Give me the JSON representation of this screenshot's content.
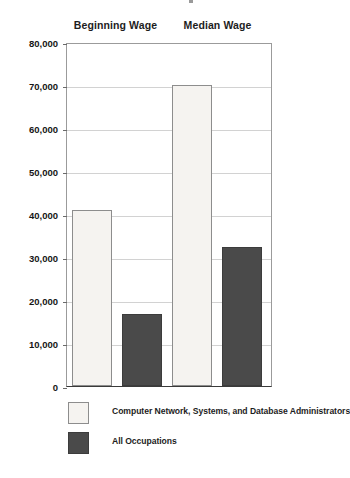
{
  "chart_data": {
    "type": "bar",
    "title": "",
    "subtitle": "",
    "xlabel": "",
    "ylabel": "",
    "grid": true,
    "legend_position": "bottom-left",
    "ylim": [
      0,
      80000
    ],
    "ytick_labels": [
      "80,000",
      "70,000",
      "60,000",
      "50,000",
      "40,000",
      "30,000",
      "20,000",
      "10,000",
      "0"
    ],
    "ytick_values": [
      80000,
      70000,
      60000,
      50000,
      40000,
      30000,
      20000,
      10000,
      0
    ],
    "categories": [
      "Beginning Wage",
      "Median Wage"
    ],
    "series": [
      {
        "name": "Computer Network, Systems, and Database Administrators",
        "color": "#f5f3f0",
        "values": [
          41000,
          70000
        ]
      },
      {
        "name": "All Occupations",
        "color": "#4a4a4a",
        "values": [
          16700,
          32400
        ]
      }
    ]
  },
  "headers": [
    {
      "label": "Beginning Wage"
    },
    {
      "label": "Median Wage"
    }
  ],
  "axis": {
    "ticks": [
      {
        "label": "80,000",
        "value": 80000
      },
      {
        "label": "70,000",
        "value": 70000
      },
      {
        "label": "60,000",
        "value": 60000
      },
      {
        "label": "50,000",
        "value": 50000
      },
      {
        "label": "40,000",
        "value": 40000
      },
      {
        "label": "30,000",
        "value": 30000
      },
      {
        "label": "20,000",
        "value": 20000
      },
      {
        "label": "10,000",
        "value": 10000
      },
      {
        "label": "0",
        "value": 0
      }
    ]
  },
  "bars": [
    {
      "label": "Beginning Wage - Computer Network, Systems, and Database Administrators",
      "value": 41000,
      "style": "light"
    },
    {
      "label": "Beginning Wage - All Occupations",
      "value": 16700,
      "style": "dark"
    },
    {
      "label": "Median Wage - Computer Network, Systems, and Database Administrators",
      "value": 70000,
      "style": "light"
    },
    {
      "label": "Median Wage - All Occupations",
      "value": 32400,
      "style": "dark"
    }
  ],
  "legend": {
    "items": [
      {
        "label": "Computer Network, Systems, and Database Administrators",
        "style": "light"
      },
      {
        "label": "All Occupations",
        "style": "dark"
      }
    ]
  }
}
